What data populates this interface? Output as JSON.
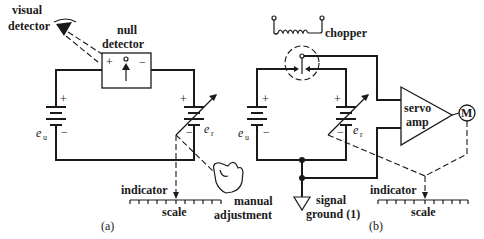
{
  "figure_a": {
    "caption": "(a)",
    "visual_detector_label": [
      "visual",
      "detector"
    ],
    "null_detector_label": [
      "null",
      "detector"
    ],
    "null_detector_plus": "+",
    "null_detector_minus": "−",
    "source_u": {
      "symbol": "e",
      "subscript": "u",
      "plus": "+",
      "minus": "−"
    },
    "source_r": {
      "symbol": "e",
      "subscript": "r",
      "plus": "+",
      "minus": "−"
    },
    "indicator_label": "indicator",
    "scale_label": "scale",
    "manual_adjustment_label": [
      "manual",
      "adjustment"
    ]
  },
  "figure_b": {
    "caption": "(b)",
    "chopper_label": "chopper",
    "source_u": {
      "symbol": "e",
      "subscript": "u",
      "plus": "+",
      "minus": "−"
    },
    "source_r": {
      "symbol": "e",
      "subscript": "r",
      "plus": "+",
      "minus": "−"
    },
    "servo_amp_label": [
      "servo",
      "amp"
    ],
    "motor_label": "M",
    "signal_ground_label": [
      "signal",
      "ground (1)"
    ],
    "indicator_label": "indicator",
    "scale_label": "scale"
  }
}
